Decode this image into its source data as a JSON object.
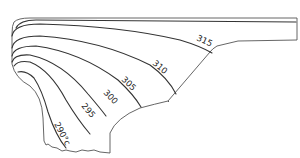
{
  "diagram": {
    "unit": "°C",
    "isotherms": [
      {
        "value": "290°c",
        "label": "290°c"
      },
      {
        "value": "295",
        "label": "295"
      },
      {
        "value": "300",
        "label": "300"
      },
      {
        "value": "305",
        "label": "305"
      },
      {
        "value": "310",
        "label": "310"
      },
      {
        "value": "315",
        "label": "315"
      }
    ],
    "colors": {
      "line": "#333333",
      "outline": "#555555",
      "background": "#ffffff"
    }
  }
}
